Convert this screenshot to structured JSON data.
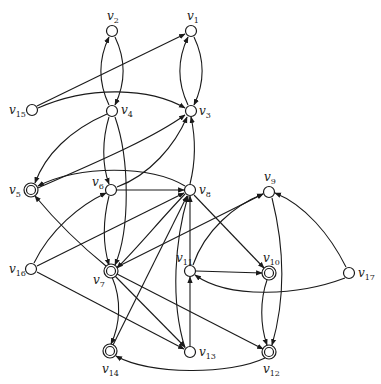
{
  "diagram": {
    "type": "directed-graph",
    "nodes": [
      {
        "id": "v1",
        "label": "v",
        "sub": "1",
        "x": 191,
        "y": 31,
        "accepting": false,
        "lx": 187,
        "ly": 20
      },
      {
        "id": "v2",
        "label": "v",
        "sub": "2",
        "x": 112,
        "y": 31,
        "accepting": false,
        "lx": 107,
        "ly": 20
      },
      {
        "id": "v3",
        "label": "v",
        "sub": "3",
        "x": 191,
        "y": 111,
        "accepting": false,
        "lx": 199,
        "ly": 115
      },
      {
        "id": "v4",
        "label": "v",
        "sub": "4",
        "x": 112,
        "y": 111,
        "accepting": false,
        "lx": 121,
        "ly": 114
      },
      {
        "id": "v5",
        "label": "v",
        "sub": "5",
        "x": 31,
        "y": 190,
        "accepting": true,
        "lx": 9,
        "ly": 194
      },
      {
        "id": "v6",
        "label": "v",
        "sub": "6",
        "x": 111,
        "y": 190,
        "accepting": false,
        "lx": 92,
        "ly": 186
      },
      {
        "id": "v7",
        "label": "v",
        "sub": "7",
        "x": 111,
        "y": 271,
        "accepting": true,
        "lx": 93,
        "ly": 284
      },
      {
        "id": "v8",
        "label": "v",
        "sub": "8",
        "x": 190,
        "y": 190,
        "accepting": false,
        "lx": 199,
        "ly": 194
      },
      {
        "id": "v9",
        "label": "v",
        "sub": "9",
        "x": 269,
        "y": 192,
        "accepting": false,
        "lx": 264,
        "ly": 181
      },
      {
        "id": "v10",
        "label": "v",
        "sub": "10",
        "x": 269,
        "y": 273,
        "accepting": true,
        "lx": 263,
        "ly": 262
      },
      {
        "id": "v11",
        "label": "v",
        "sub": "11",
        "x": 190,
        "y": 271,
        "accepting": false,
        "lx": 176,
        "ly": 262
      },
      {
        "id": "v12",
        "label": "v",
        "sub": "12",
        "x": 269,
        "y": 352,
        "accepting": true,
        "lx": 263,
        "ly": 373
      },
      {
        "id": "v13",
        "label": "v",
        "sub": "13",
        "x": 190,
        "y": 352,
        "accepting": false,
        "lx": 199,
        "ly": 356
      },
      {
        "id": "v14",
        "label": "v",
        "sub": "14",
        "x": 110,
        "y": 351,
        "accepting": true,
        "lx": 102,
        "ly": 373
      },
      {
        "id": "v15",
        "label": "v",
        "sub": "15",
        "x": 32,
        "y": 110,
        "accepting": false,
        "lx": 9,
        "ly": 114
      },
      {
        "id": "v16",
        "label": "v",
        "sub": "16",
        "x": 31,
        "y": 269,
        "accepting": false,
        "lx": 9,
        "ly": 273
      },
      {
        "id": "v17",
        "label": "v",
        "sub": "17",
        "x": 349,
        "y": 273,
        "accepting": false,
        "lx": 358,
        "ly": 277
      }
    ],
    "edges": [
      {
        "from": "v2",
        "to": "v4",
        "curve": "right"
      },
      {
        "from": "v4",
        "to": "v2",
        "curve": "left"
      },
      {
        "from": "v1",
        "to": "v3",
        "curve": "right"
      },
      {
        "from": "v3",
        "to": "v1",
        "curve": "left"
      },
      {
        "from": "v15",
        "to": "v1"
      },
      {
        "from": "v15",
        "to": "v3",
        "curve": "arc"
      },
      {
        "from": "v4",
        "to": "v5",
        "curve": "arc"
      },
      {
        "from": "v4",
        "to": "v6",
        "curve": "down"
      },
      {
        "from": "v4",
        "to": "v7",
        "curve": "down"
      },
      {
        "from": "v5",
        "to": "v3"
      },
      {
        "from": "v6",
        "to": "v3",
        "curve": "arc"
      },
      {
        "from": "v8",
        "to": "v5",
        "curve": "arc"
      },
      {
        "from": "v8",
        "to": "v3",
        "curve": "straight"
      },
      {
        "from": "v6",
        "to": "v8"
      },
      {
        "from": "v6",
        "to": "v7",
        "curve": "down"
      },
      {
        "from": "v8",
        "to": "v7"
      },
      {
        "from": "v8",
        "to": "v10"
      },
      {
        "from": "v16",
        "to": "v6",
        "curve": "arc"
      },
      {
        "from": "v16",
        "to": "v8"
      },
      {
        "from": "v16",
        "to": "v13"
      },
      {
        "from": "v7",
        "to": "v5"
      },
      {
        "from": "v7",
        "to": "v9"
      },
      {
        "from": "v7",
        "to": "v13"
      },
      {
        "from": "v7",
        "to": "v12"
      },
      {
        "from": "v7",
        "to": "v14",
        "curve": "arc"
      },
      {
        "from": "v14",
        "to": "v8"
      },
      {
        "from": "v13",
        "to": "v8",
        "curve": "arc"
      },
      {
        "from": "v13",
        "to": "v8",
        "curve": "arc2"
      },
      {
        "from": "v13",
        "to": "v11"
      },
      {
        "from": "v11",
        "to": "v8"
      },
      {
        "from": "v11",
        "to": "v9",
        "curve": "arc"
      },
      {
        "from": "v11",
        "to": "v10"
      },
      {
        "from": "v9",
        "to": "v12",
        "curve": "arc"
      },
      {
        "from": "v10",
        "to": "v12",
        "curve": "arc"
      },
      {
        "from": "v17",
        "to": "v9",
        "curve": "arc"
      },
      {
        "from": "v17",
        "to": "v11",
        "curve": "arc"
      },
      {
        "from": "v12",
        "to": "v14",
        "curve": "arc"
      }
    ]
  }
}
